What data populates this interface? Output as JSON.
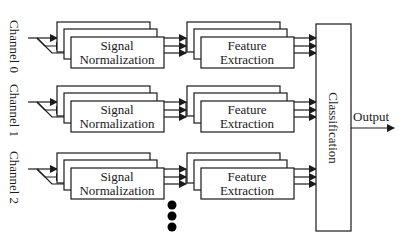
{
  "diagram": {
    "channels": [
      {
        "label": "Channel 0",
        "signal_block": [
          "Signal",
          "Normalization"
        ],
        "feature_block": [
          "Feature",
          "Extraction"
        ]
      },
      {
        "label": "Channel 1",
        "signal_block": [
          "Signal",
          "Normalization"
        ],
        "feature_block": [
          "Feature",
          "Extraction"
        ]
      },
      {
        "label": "Channel 2",
        "signal_block": [
          "Signal",
          "Normalization"
        ],
        "feature_block": [
          "Feature",
          "Extraction"
        ]
      }
    ],
    "classifier": {
      "label": "Classification"
    },
    "output": {
      "label": "Output"
    },
    "continuation": {
      "symbol": "vertical-ellipsis-dots",
      "count": 3
    },
    "colors": {
      "stroke": "#1a1a1a",
      "background": "#ffffff"
    }
  }
}
